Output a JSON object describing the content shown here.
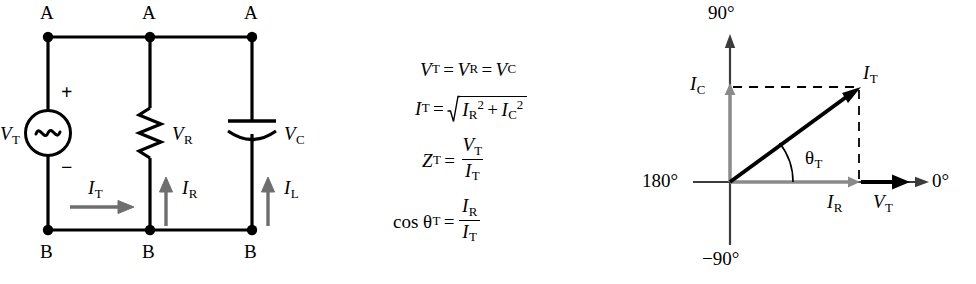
{
  "figure": {
    "colors": {
      "line": "#000000",
      "current_arrow": "#6e6e6e",
      "dashed": "#000000",
      "background": "#ffffff"
    }
  },
  "circuit": {
    "caption": "Parallel RC circuit",
    "node_labels_top": [
      "A",
      "A",
      "A"
    ],
    "node_labels_bottom": [
      "B",
      "B",
      "B"
    ],
    "source": {
      "label": "V",
      "label_sub": "T",
      "symbol": "ac-source-sine",
      "plus": "+",
      "minus": "−"
    },
    "resistor": {
      "label": "V",
      "label_sub": "R",
      "symbol": "zigzag-resistor"
    },
    "capacitor": {
      "label": "V",
      "label_sub": "C",
      "symbol": "curved-plate-capacitor"
    },
    "currents": [
      {
        "name": "total-current",
        "label": "I",
        "label_sub": "T",
        "direction": "right"
      },
      {
        "name": "resistor-current",
        "label": "I",
        "label_sub": "R",
        "direction": "up"
      },
      {
        "name": "capacitor-current",
        "label": "I",
        "label_sub": "L",
        "direction": "up"
      }
    ]
  },
  "equations": {
    "eq1": {
      "lhs": "V",
      "lhs_sub": "T",
      "eq1op": "=",
      "mid": "V",
      "mid_sub": "R",
      "eq2op": "=",
      "rhs": "V",
      "rhs_sub": "C",
      "plain": "V_T = V_R = V_C"
    },
    "eq2": {
      "lhs": "I",
      "lhs_sub": "T",
      "op": "=",
      "radicand_a": "I",
      "radicand_a_sub": "R",
      "radicand_a_sup": "2",
      "plus": "+",
      "radicand_b": "I",
      "radicand_b_sub": "C",
      "radicand_b_sup": "2",
      "plain": "I_T = sqrt(I_R^2 + I_C^2)"
    },
    "eq3": {
      "lhs": "Z",
      "lhs_sub": "T",
      "op": "=",
      "num": "V",
      "num_sub": "T",
      "den": "I",
      "den_sub": "T",
      "plain": "Z_T = V_T / I_T"
    },
    "eq4": {
      "lhs_fn": "cos",
      "lhs": "θ",
      "lhs_sub": "T",
      "op": "=",
      "num": "I",
      "num_sub": "R",
      "den": "I",
      "den_sub": "T",
      "plain": "cos theta_T = I_R / I_T"
    }
  },
  "phasor": {
    "caption": "Phasor diagram for parallel RC circuit",
    "axis_labels": {
      "top": "90°",
      "right": "0°",
      "left": "180°",
      "bottom": "−90°"
    },
    "vectors": [
      {
        "name": "total-current-phasor",
        "label": "I",
        "label_sub": "T",
        "angle_deg": 38,
        "style": "solid-black"
      },
      {
        "name": "capacitive-current-phasor",
        "label": "I",
        "label_sub": "C",
        "angle_deg": 90,
        "style": "solid-gray"
      },
      {
        "name": "resistive-current-phasor",
        "label": "I",
        "label_sub": "R",
        "angle_deg": 0,
        "style": "solid-gray"
      },
      {
        "name": "total-voltage-phasor",
        "label": "V",
        "label_sub": "T",
        "angle_deg": 0,
        "style": "solid-black"
      }
    ],
    "angle_label": {
      "label": "θ",
      "label_sub": "T"
    }
  }
}
